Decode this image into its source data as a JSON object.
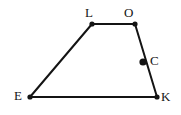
{
  "figure": {
    "kind": "geometry-diagram",
    "background_color": "#ffffff",
    "stroke_color": "#141414",
    "label_color": "#141414",
    "stroke_width": 2,
    "vertex_dot_radius": 2.6,
    "marked_point_radius": 3.6,
    "canvas": {
      "width": 181,
      "height": 115
    },
    "points": [
      {
        "id": "L",
        "label": "L",
        "x": 92,
        "y": 24,
        "dot": "vertex",
        "label_x": 85,
        "label_y": 6
      },
      {
        "id": "O",
        "label": "O",
        "x": 135,
        "y": 24,
        "dot": "vertex",
        "label_x": 124,
        "label_y": 6
      },
      {
        "id": "C",
        "label": "C",
        "x": 143,
        "y": 62,
        "dot": "marked-point",
        "label_x": 150,
        "label_y": 54
      },
      {
        "id": "K",
        "label": "K",
        "x": 157,
        "y": 97,
        "dot": "vertex",
        "label_x": 161,
        "label_y": 90
      },
      {
        "id": "E",
        "label": "E",
        "x": 30,
        "y": 97,
        "dot": "vertex",
        "label_x": 14,
        "label_y": 89
      }
    ],
    "segments": [
      {
        "id": "LO",
        "from": "L",
        "to": "O"
      },
      {
        "id": "OK",
        "from": "O",
        "to": "K"
      },
      {
        "id": "KE",
        "from": "K",
        "to": "E"
      },
      {
        "id": "EL",
        "from": "E",
        "to": "L"
      }
    ]
  }
}
